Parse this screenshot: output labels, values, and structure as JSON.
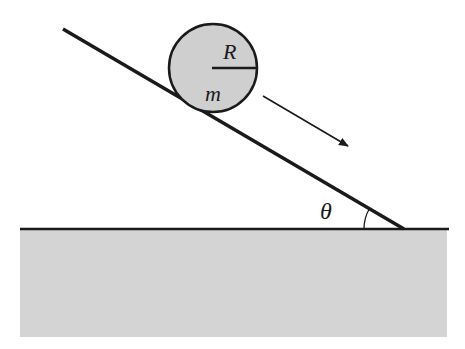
{
  "diagram": {
    "type": "physics-inclined-plane",
    "labels": {
      "radius": "R",
      "mass": "m",
      "angle": "θ"
    },
    "colors": {
      "ground_fill": "#d4d4d4",
      "ball_fill": "#cfcfcf",
      "line": "#1a1a1a",
      "background": "#ffffff"
    },
    "elements": {
      "ball": {
        "description": "rolling ball of radius R and mass m"
      },
      "incline": {
        "description": "inclined plane at angle θ"
      },
      "arrow": {
        "description": "direction of motion down the incline"
      },
      "ground": {
        "description": "horizontal ground surface"
      }
    }
  }
}
